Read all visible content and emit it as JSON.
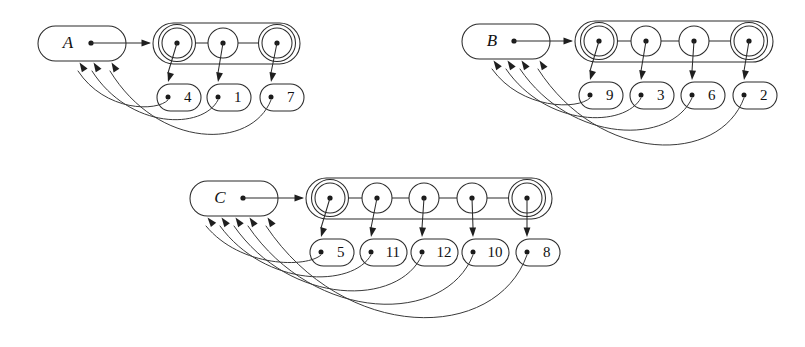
{
  "figure": {
    "background_color": "#ffffff",
    "line_color": "#2b2b2b",
    "width": 805,
    "height": 347
  },
  "groups": [
    {
      "id": "A",
      "label": "A",
      "header": {
        "x": 38,
        "y": 26,
        "width": 88,
        "height": 35,
        "dot_x": 91,
        "dot_y": 43
      },
      "chain": {
        "container": {
          "x": 153,
          "y": 23,
          "width": 147,
          "height": 41
        },
        "node_y": 43,
        "node_r": 15,
        "nodes": [
          {
            "cx": 177,
            "double": true
          },
          {
            "cx": 223,
            "double": false
          },
          {
            "cx": 277,
            "double": true
          }
        ]
      },
      "leaves": [
        {
          "value": "4",
          "x": 157,
          "y": 84,
          "width": 44,
          "height": 27,
          "dot_x": 168,
          "dot_y": 97
        },
        {
          "value": "1",
          "x": 207,
          "y": 84,
          "width": 44,
          "height": 27,
          "dot_x": 218,
          "dot_y": 97
        },
        {
          "value": "7",
          "x": 260,
          "y": 84,
          "width": 44,
          "height": 27,
          "dot_x": 271,
          "dot_y": 97
        }
      ],
      "back_arrow_targets": [
        {
          "x": 78,
          "y": 62
        },
        {
          "x": 92,
          "y": 62
        },
        {
          "x": 110,
          "y": 62
        }
      ],
      "back_curve_depths": [
        112,
        130,
        150
      ]
    },
    {
      "id": "B",
      "label": "B",
      "header": {
        "x": 462,
        "y": 24,
        "width": 88,
        "height": 35,
        "dot_x": 514,
        "dot_y": 41
      },
      "chain": {
        "container": {
          "x": 575,
          "y": 21,
          "width": 198,
          "height": 41
        },
        "node_y": 41,
        "node_r": 15,
        "nodes": [
          {
            "cx": 599,
            "double": true
          },
          {
            "cx": 646,
            "double": false
          },
          {
            "cx": 694,
            "double": false
          },
          {
            "cx": 749,
            "double": true
          }
        ]
      },
      "leaves": [
        {
          "value": "9",
          "x": 579,
          "y": 82,
          "width": 44,
          "height": 27,
          "dot_x": 590,
          "dot_y": 95
        },
        {
          "value": "3",
          "x": 630,
          "y": 82,
          "width": 44,
          "height": 27,
          "dot_x": 641,
          "dot_y": 95
        },
        {
          "value": "6",
          "x": 681,
          "y": 82,
          "width": 44,
          "height": 27,
          "dot_x": 692,
          "dot_y": 95
        },
        {
          "value": "2",
          "x": 733,
          "y": 82,
          "width": 44,
          "height": 27,
          "dot_x": 744,
          "dot_y": 95
        }
      ],
      "back_arrow_targets": [
        {
          "x": 492,
          "y": 60
        },
        {
          "x": 506,
          "y": 60
        },
        {
          "x": 520,
          "y": 60
        },
        {
          "x": 538,
          "y": 60
        }
      ],
      "back_curve_depths": [
        110,
        128,
        145,
        165
      ]
    },
    {
      "id": "C",
      "label": "C",
      "header": {
        "x": 190,
        "y": 181,
        "width": 88,
        "height": 35,
        "dot_x": 243,
        "dot_y": 198
      },
      "chain": {
        "container": {
          "x": 306,
          "y": 178,
          "width": 246,
          "height": 41
        },
        "node_y": 198,
        "node_r": 15,
        "nodes": [
          {
            "cx": 330,
            "double": true
          },
          {
            "cx": 377,
            "double": false
          },
          {
            "cx": 424,
            "double": false
          },
          {
            "cx": 472,
            "double": false
          },
          {
            "cx": 527,
            "double": true
          }
        ]
      },
      "leaves": [
        {
          "value": "5",
          "x": 310,
          "y": 239,
          "width": 44,
          "height": 27,
          "dot_x": 321,
          "dot_y": 252
        },
        {
          "value": "11",
          "x": 360,
          "y": 239,
          "width": 47,
          "height": 27,
          "dot_x": 371,
          "dot_y": 252
        },
        {
          "value": "12",
          "x": 411,
          "y": 239,
          "width": 47,
          "height": 27,
          "dot_x": 422,
          "dot_y": 252
        },
        {
          "value": "10",
          "x": 462,
          "y": 239,
          "width": 47,
          "height": 27,
          "dot_x": 473,
          "dot_y": 252
        },
        {
          "value": "8",
          "x": 516,
          "y": 239,
          "width": 44,
          "height": 27,
          "dot_x": 527,
          "dot_y": 252
        }
      ],
      "back_arrow_targets": [
        {
          "x": 206,
          "y": 217
        },
        {
          "x": 220,
          "y": 217
        },
        {
          "x": 234,
          "y": 217
        },
        {
          "x": 248,
          "y": 217
        },
        {
          "x": 266,
          "y": 217
        }
      ],
      "back_curve_depths": [
        268,
        288,
        307,
        325,
        343
      ]
    }
  ]
}
